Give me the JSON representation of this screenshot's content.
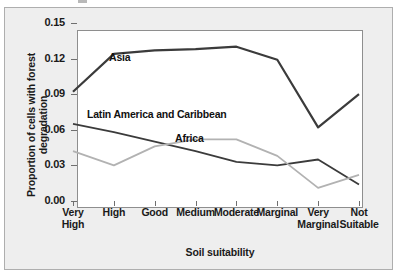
{
  "figure": {
    "background": "#eeeeee",
    "plot_background": "#ffffff",
    "frame_color": "#8e8e8e"
  },
  "axes": {
    "y_title": "Proportion of cells with forest degradation",
    "x_title": "Soil suitability",
    "y_ticks": [
      "0.15",
      "0.12",
      "0.09",
      "0.06",
      "0.03",
      "0.00"
    ],
    "x_ticks": [
      {
        "line1": "Very",
        "line2": "High"
      },
      {
        "line1": "High",
        "line2": ""
      },
      {
        "line1": "Good",
        "line2": ""
      },
      {
        "line1": "Medium",
        "line2": ""
      },
      {
        "line1": "Moderate",
        "line2": ""
      },
      {
        "line1": "Marginal",
        "line2": ""
      },
      {
        "line1": "Very",
        "line2": "Marginal"
      },
      {
        "line1": "Not",
        "line2": "Suitable"
      }
    ]
  },
  "annotations": {
    "asia": "Asia",
    "latin_america_line1": "Latin America",
    "latin_america_line2": "and Caribbean",
    "africa": "Africa"
  },
  "chart_data": {
    "type": "line",
    "title": "",
    "xlabel": "Soil suitability",
    "ylabel": "Proportion of cells with forest degradation",
    "ylim": [
      0.0,
      0.15
    ],
    "ytick_values": [
      0.15,
      0.12,
      0.09,
      0.06,
      0.03,
      0.0
    ],
    "grid": false,
    "legend": "inline-annotations",
    "categories": [
      "Very High",
      "High",
      "Good",
      "Medium",
      "Moderate",
      "Marginal",
      "Very Marginal",
      "Not Suitable"
    ],
    "series": [
      {
        "name": "Asia",
        "color": "#3b3b3b",
        "line_width": 2.2,
        "values": [
          0.092,
          0.124,
          0.127,
          0.128,
          0.13,
          0.119,
          0.062,
          0.09
        ]
      },
      {
        "name": "Latin America and Caribbean",
        "color": "#3b3b3b",
        "line_width": 1.8,
        "values": [
          0.065,
          0.058,
          0.05,
          0.042,
          0.033,
          0.03,
          0.035,
          0.014
        ]
      },
      {
        "name": "Africa",
        "color": "#b2b2b2",
        "line_width": 1.8,
        "values": [
          0.042,
          0.03,
          0.046,
          0.052,
          0.052,
          0.038,
          0.011,
          0.022
        ]
      }
    ]
  }
}
